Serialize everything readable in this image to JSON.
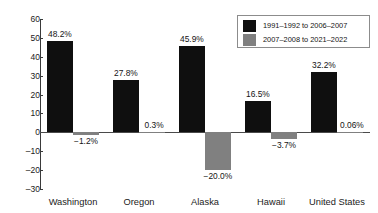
{
  "chart_data": {
    "type": "bar",
    "title": "",
    "xlabel": "",
    "ylabel": "",
    "ylim": [
      -30,
      60
    ],
    "ytick_step": 10,
    "grid": false,
    "legend_position": "top-right",
    "categories": [
      "Washington",
      "Oregon",
      "Alaska",
      "Hawaii",
      "United States"
    ],
    "ytick_labels": [
      "60",
      "50",
      "40",
      "30",
      "20",
      "10",
      "0",
      "–10",
      "–20",
      "–30"
    ],
    "ytick_values": [
      60,
      50,
      40,
      30,
      20,
      10,
      0,
      -10,
      -20,
      -30
    ],
    "series": [
      {
        "name": "1991–1992 to 2006–2007",
        "color": "#0f0f0f",
        "values": [
          48.2,
          27.8,
          45.9,
          16.5,
          32.2
        ],
        "labels": [
          "48.2%",
          "27.8%",
          "45.9%",
          "16.5%",
          "32.2%"
        ]
      },
      {
        "name": "2007–2008 to 2021–2022",
        "color": "#808080",
        "values": [
          -1.2,
          0.3,
          -20.0,
          -3.7,
          0.06
        ],
        "labels": [
          "−1.2%",
          "0.3%",
          "−20.0%",
          "−3.7%",
          "0.06%"
        ]
      }
    ]
  },
  "legend": {
    "entries": [
      {
        "label": "1991–1992 to 2006–2007",
        "color": "#0f0f0f"
      },
      {
        "label": "2007–2008 to 2021–2022",
        "color": "#808080"
      }
    ]
  },
  "colors": {
    "series_1": "#0f0f0f",
    "series_2": "#808080",
    "axis": "#3a3a3a",
    "background": "#ffffff",
    "text": "#141414"
  }
}
